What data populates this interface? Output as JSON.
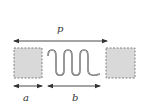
{
  "diagram": {
    "labels": {
      "p": "p",
      "a": "a",
      "b": "b"
    },
    "colors": {
      "line": "#333333",
      "pad_fill": "#d9d9d9",
      "pad_border": "#777777",
      "meander": "#555555"
    },
    "elements": {
      "left_pad": "square pad (dashed border, gray fill)",
      "meander": "serpentine / meander line",
      "right_pad": "square pad (dashed border, gray fill)"
    },
    "dimensions": [
      {
        "name": "p",
        "description": "pitch — from left edge of left pad to left edge of right pad"
      },
      {
        "name": "a",
        "description": "pad width"
      },
      {
        "name": "b",
        "description": "meander width"
      }
    ]
  }
}
